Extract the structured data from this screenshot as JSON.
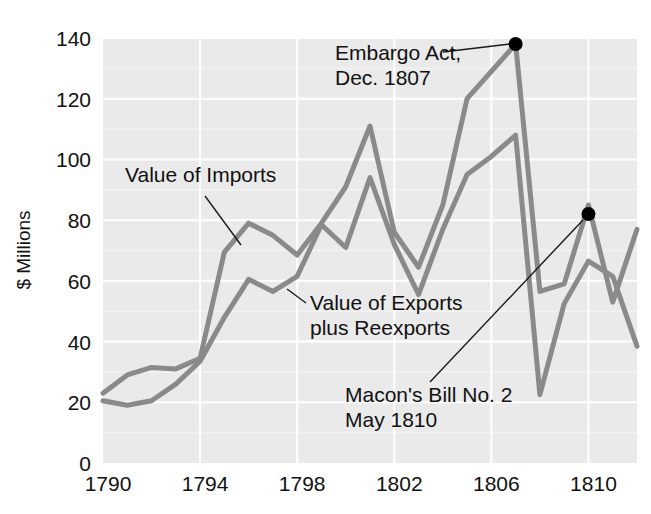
{
  "chart_data": {
    "type": "line",
    "title": "",
    "subtitle": "",
    "xlabel": "",
    "ylabel": "$ Millions",
    "xlim": [
      1790,
      1812
    ],
    "ylim": [
      0,
      140
    ],
    "grid": true,
    "legend_position": "inline-annotations",
    "x_ticks": [
      "1790",
      "1794",
      "1798",
      "1802",
      "1806",
      "1810"
    ],
    "x_tick_values": [
      1790,
      1794,
      1798,
      1802,
      1806,
      1810
    ],
    "y_ticks": [
      "0",
      "20",
      "40",
      "60",
      "80",
      "100",
      "120",
      "140"
    ],
    "y_tick_values": [
      0,
      20,
      40,
      60,
      80,
      100,
      120,
      140
    ],
    "x": [
      1790,
      1791,
      1792,
      1793,
      1794,
      1795,
      1796,
      1797,
      1798,
      1799,
      1800,
      1801,
      1802,
      1803,
      1804,
      1805,
      1806,
      1807,
      1808,
      1809,
      1810,
      1811,
      1812
    ],
    "series": [
      {
        "name": "Value of Imports",
        "color": "#8a8a8a",
        "values": [
          23,
          29,
          31.5,
          31,
          34.5,
          69.5,
          79,
          75,
          68.5,
          79,
          91,
          111,
          76,
          64.5,
          85,
          120,
          129,
          138,
          56.5,
          59,
          85,
          53,
          77
        ]
      },
      {
        "name": "Value of Exports plus Reexports",
        "color": "#8a8a8a",
        "values": [
          20.5,
          19,
          20.5,
          26,
          33.5,
          48,
          60.5,
          56.5,
          61.5,
          78.5,
          71,
          94,
          72,
          55.5,
          77,
          95,
          101,
          108,
          22.5,
          52.5,
          66.5,
          61.5,
          38.5
        ]
      }
    ],
    "annotations": [
      {
        "id": "embargo-act",
        "lines": [
          "Embargo Act,",
          "Dec. 1807"
        ],
        "text_x": 335,
        "text_y": 60,
        "leader": [
          [
            443,
            52
          ],
          [
            510,
            44
          ]
        ],
        "marker": {
          "x": 1807,
          "y": 138
        }
      },
      {
        "id": "macons-bill",
        "lines": [
          "Macon's Bill No. 2",
          "May 1810"
        ],
        "text_x": 345,
        "text_y": 402,
        "leader": [
          [
            430,
            382
          ],
          [
            583,
            220
          ]
        ],
        "marker": {
          "x": 1810,
          "y": 82
        }
      },
      {
        "id": "value-of-imports-label",
        "lines": [
          "Value of Imports"
        ],
        "text_x": 125,
        "text_y": 182,
        "leader": [
          [
            205,
            196
          ],
          [
            241,
            245
          ]
        ],
        "marker": null
      },
      {
        "id": "value-of-exports-label",
        "lines": [
          "Value of Exports",
          "plus Reexports"
        ],
        "text_x": 310,
        "text_y": 310,
        "leader": [
          [
            306,
            303
          ],
          [
            287,
            289
          ]
        ],
        "marker": null
      }
    ],
    "colors": {
      "plot_background": "#eaeaea",
      "gridline": "#ffffff",
      "line": "#8a8a8a",
      "text": "#111111",
      "marker": "#000000",
      "page_background": "#ffffff"
    }
  }
}
